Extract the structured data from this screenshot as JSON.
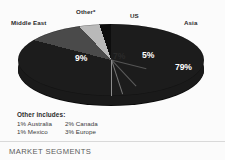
{
  "chart_data": {
    "type": "pie",
    "title": "",
    "style": "3d-grayscale",
    "legend_position": "outer-labels",
    "categories": [
      "Asia",
      "Middle East",
      "Other*",
      "US"
    ],
    "values": [
      79,
      9,
      7,
      5
    ],
    "value_labels": [
      "79%",
      "9%",
      "7%",
      "5%"
    ],
    "unit": "%",
    "colors": [
      "#1c1c1c",
      "#4a4a4a",
      "#b9b9b9",
      "#0d0d0d"
    ],
    "slices": [
      {
        "label": "Asia",
        "value": 79,
        "value_label": "79%",
        "color": "#1c1c1c"
      },
      {
        "label": "Middle East",
        "value": 9,
        "value_label": "9%",
        "color": "#4a4a4a"
      },
      {
        "label": "Other*",
        "value": 7,
        "value_label": "7%",
        "color": "#b9b9b9"
      },
      {
        "label": "US",
        "value": 5,
        "value_label": "5%",
        "color": "#0d0d0d"
      }
    ],
    "footnote": {
      "title": "Other includes:",
      "entries": [
        {
          "pct": "1%",
          "name": "Australia"
        },
        {
          "pct": "2%",
          "name": "Canada"
        },
        {
          "pct": "1%",
          "name": "Mexico"
        },
        {
          "pct": "3%",
          "name": "Europe"
        }
      ]
    },
    "caption": "MARKET SEGMENTS"
  },
  "labels": {
    "middle_east": "Middle East",
    "other": "Other*",
    "us": "US",
    "asia": "Asia"
  },
  "percents": {
    "middle_east": "9%",
    "other": "7%",
    "us": "5%",
    "asia": "79%"
  },
  "footnote": {
    "title": "Other includes:",
    "r0c0_pct": "1%",
    "r0c0_name": "Australia",
    "r0c1_pct": "2%",
    "r0c1_name": "Canada",
    "r1c0_pct": "1%",
    "r1c0_name": "Mexico",
    "r1c1_pct": "3%",
    "r1c1_name": "Europe"
  },
  "caption": "MARKET SEGMENTS"
}
